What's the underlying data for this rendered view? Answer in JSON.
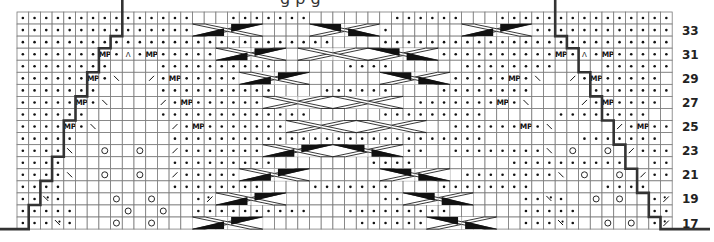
{
  "title_fragment": "g p g",
  "grid": {
    "columns": 56,
    "first_row_number": 34,
    "last_row_number": 17,
    "row_labels": [
      "33",
      "31",
      "29",
      "27",
      "25",
      "23",
      "21",
      "19",
      "17"
    ],
    "legend_codes": {
      ".": "purl",
      " ": "knit",
      "M": "make-purl (MP)",
      "A": "double decrease",
      "\\": "left-leaning decrease",
      "/": "right-leaning decrease",
      "O": "yarn over",
      "y": "twisted decrease left",
      "z": "twisted decrease right"
    },
    "rows": [
      "...............   .......       ......   ...............",
      "...............            .....      ..................",
      "...........................    .........................",
      ".......M.A.M...........            ...........M.A.M.....",
      "........    ..........      ....      ........    ......",
      "......M.\\  /.M.......             ........M.\\  /.M.....",
      ".......     ..........    ......    ........     .......",
      ".....M.\\    /.M.........          .......M.\\    /.M....",
      "......      .............      .........      ........",
      "....M.\\      /.M...................  ......M.\\     /.M...",
      ".....        ...........................        .......",
      "....\\  O  O  /..........   ........  ........\\ O  O /....",
      "....         .........        ....        ..........  ...",
      "....\\  O  O  /.........         .     ........\\ O  O /...",
      "....         ........    .......    ........      ....",
      "..y.    O  O   .z.....         .......     ..y.  O O  .z..",
      ".....    O  O  ..........   .........      .....      ..",
      "...y.   O  O   .z....        ..........    ...y.  O O .z..."
    ],
    "cables": [
      {
        "row": 33,
        "from_col": 15,
        "to_col": 21,
        "dir": "right"
      },
      {
        "row": 33,
        "from_col": 25,
        "to_col": 31,
        "dir": "left"
      },
      {
        "row": 33,
        "from_col": 38,
        "to_col": 44,
        "dir": "right"
      },
      {
        "row": 31,
        "from_col": 17,
        "to_col": 23,
        "dir": "right"
      },
      {
        "row": 31,
        "from_col": 24,
        "to_col": 30,
        "dir": "lattice"
      },
      {
        "row": 31,
        "from_col": 30,
        "to_col": 36,
        "dir": "left"
      },
      {
        "row": 29,
        "from_col": 19,
        "to_col": 25,
        "dir": "right"
      },
      {
        "row": 29,
        "from_col": 31,
        "to_col": 37,
        "dir": "left"
      },
      {
        "row": 27,
        "from_col": 21,
        "to_col": 27,
        "dir": "lattice"
      },
      {
        "row": 27,
        "from_col": 27,
        "to_col": 33,
        "dir": "lattice"
      },
      {
        "row": 25,
        "from_col": 23,
        "to_col": 29,
        "dir": "lattice"
      },
      {
        "row": 25,
        "from_col": 29,
        "to_col": 35,
        "dir": "lattice"
      },
      {
        "row": 23,
        "from_col": 21,
        "to_col": 27,
        "dir": "right"
      },
      {
        "row": 23,
        "from_col": 27,
        "to_col": 33,
        "dir": "left"
      },
      {
        "row": 21,
        "from_col": 19,
        "to_col": 25,
        "dir": "right"
      },
      {
        "row": 21,
        "from_col": 31,
        "to_col": 37,
        "dir": "left"
      },
      {
        "row": 19,
        "from_col": 17,
        "to_col": 23,
        "dir": "right"
      },
      {
        "row": 19,
        "from_col": 33,
        "to_col": 39,
        "dir": "left"
      },
      {
        "row": 17,
        "from_col": 15,
        "to_col": 21,
        "dir": "right"
      },
      {
        "row": 17,
        "from_col": 35,
        "to_col": 41,
        "dir": "left"
      }
    ],
    "left_edge_steps": [
      9,
      9,
      8,
      7,
      7,
      6,
      6,
      5,
      5,
      4,
      4,
      4,
      3,
      3,
      2,
      2,
      1,
      1
    ],
    "right_edge_steps": [
      46,
      46,
      47,
      48,
      48,
      49,
      49,
      50,
      50,
      51,
      51,
      52,
      52,
      53,
      53,
      54,
      54,
      55
    ]
  }
}
